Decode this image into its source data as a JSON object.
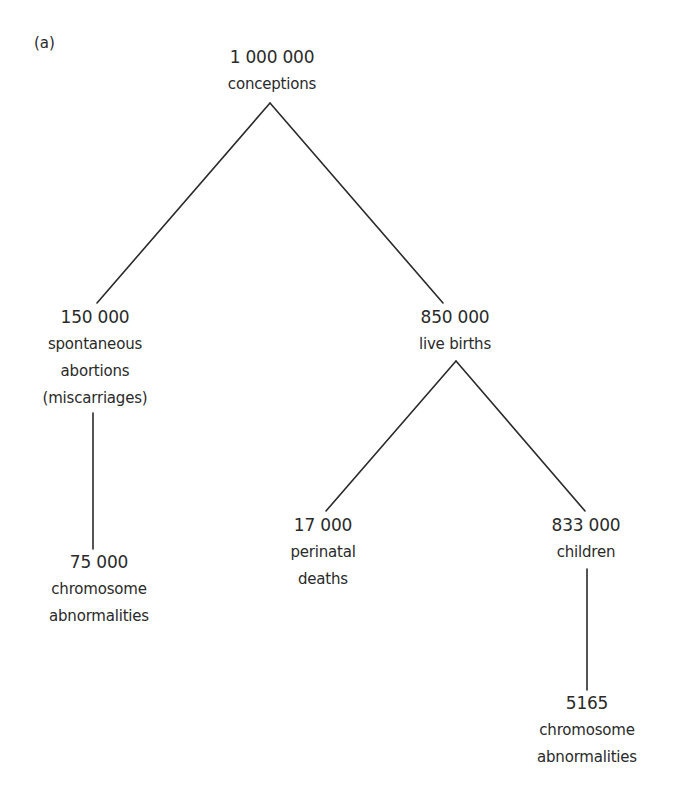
{
  "panel_label": "(a)",
  "nodes": {
    "root": {
      "value": "1 000 000",
      "label_lines": [
        "conceptions"
      ]
    },
    "miscarriages": {
      "value": "150 000",
      "label_lines": [
        "spontaneous",
        "abortions",
        "(miscarriages)"
      ]
    },
    "live_births": {
      "value": "850 000",
      "label_lines": [
        "live births"
      ]
    },
    "miscarriage_chromosome": {
      "value": "75 000",
      "label_lines": [
        "chromosome",
        "abnormalities"
      ]
    },
    "perinatal_deaths": {
      "value": "17 000",
      "label_lines": [
        "perinatal",
        "deaths"
      ]
    },
    "children": {
      "value": "833 000",
      "label_lines": [
        "children"
      ]
    },
    "children_chromosome": {
      "value": "5165",
      "label_lines": [
        "chromosome",
        "abnormalities"
      ]
    }
  },
  "edges": [
    [
      "root",
      "miscarriages"
    ],
    [
      "root",
      "live_births"
    ],
    [
      "miscarriages",
      "miscarriage_chromosome"
    ],
    [
      "live_births",
      "perinatal_deaths"
    ],
    [
      "live_births",
      "children"
    ],
    [
      "children",
      "children_chromosome"
    ]
  ],
  "colors": {
    "line": "#2a2a2a",
    "text": "#2a2a2a",
    "background": "#ffffff"
  }
}
